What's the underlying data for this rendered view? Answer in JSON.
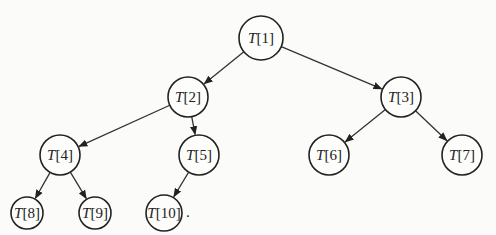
{
  "diagram": {
    "type": "binary-tree",
    "nodes": [
      {
        "id": 1,
        "array": "T",
        "index": "[1]",
        "label": "T[1]",
        "x": 261,
        "y": 38,
        "r": 22
      },
      {
        "id": 2,
        "array": "T",
        "index": "[2]",
        "label": "T[2]",
        "x": 188,
        "y": 97,
        "r": 20
      },
      {
        "id": 3,
        "array": "T",
        "index": "[3]",
        "label": "T[3]",
        "x": 401,
        "y": 97,
        "r": 20
      },
      {
        "id": 4,
        "array": "T",
        "index": "[4]",
        "label": "T[4]",
        "x": 60,
        "y": 155,
        "r": 20
      },
      {
        "id": 5,
        "array": "T",
        "index": "[5]",
        "label": "T[5]",
        "x": 199,
        "y": 155,
        "r": 20
      },
      {
        "id": 6,
        "array": "T",
        "index": "[6]",
        "label": "T[6]",
        "x": 329,
        "y": 155,
        "r": 20
      },
      {
        "id": 7,
        "array": "T",
        "index": "[7]",
        "label": "T[7]",
        "x": 462,
        "y": 155,
        "r": 20
      },
      {
        "id": 8,
        "array": "T",
        "index": "[8]",
        "label": "T[8]",
        "x": 27,
        "y": 213,
        "r": 16
      },
      {
        "id": 9,
        "array": "T",
        "index": "[9]",
        "label": "T[9]",
        "x": 95,
        "y": 213,
        "r": 16
      },
      {
        "id": 10,
        "array": "T",
        "index": "[10]",
        "label": "T[10]",
        "x": 164,
        "y": 213,
        "r": 18
      }
    ],
    "edges": [
      {
        "from": 1,
        "to": 2
      },
      {
        "from": 1,
        "to": 3
      },
      {
        "from": 2,
        "to": 4
      },
      {
        "from": 2,
        "to": 5
      },
      {
        "from": 3,
        "to": 6
      },
      {
        "from": 3,
        "to": 7
      },
      {
        "from": 4,
        "to": 8
      },
      {
        "from": 4,
        "to": 9
      },
      {
        "from": 5,
        "to": 10
      }
    ],
    "trailing_mark": "."
  }
}
